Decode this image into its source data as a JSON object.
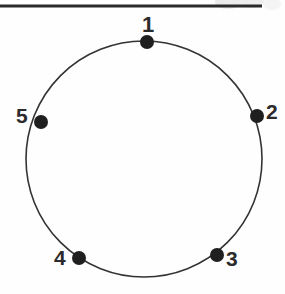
{
  "figure": {
    "type": "diagram",
    "background_color": "#fefefe",
    "ink_color": "#2b2b2b",
    "width": 285,
    "height": 294
  },
  "top_rule": {
    "name": "horizontal-rule",
    "x1": 0,
    "y1": 5,
    "x2": 262,
    "y2": 7,
    "stroke_width": 3,
    "color": "#2b2b2b"
  },
  "circle": {
    "center_x": 144,
    "center_y": 159,
    "radius": 118,
    "stroke_width": 1.6,
    "stroke_color": "#333333",
    "fill": "none"
  },
  "dot_style": {
    "radius": 7,
    "fill": "#1f1f1f"
  },
  "points": [
    {
      "label": "1",
      "x": 147,
      "y": 42,
      "angle_deg": 95,
      "label_x": 142,
      "label_y": 14,
      "label_position": "above"
    },
    {
      "label": "2",
      "x": 257,
      "y": 116,
      "angle_deg": 21,
      "label_x": 266,
      "label_y": 101,
      "label_position": "right"
    },
    {
      "label": "3",
      "x": 217,
      "y": 255,
      "angle_deg": -54,
      "label_x": 226,
      "label_y": 248,
      "label_position": "right"
    },
    {
      "label": "4",
      "x": 79,
      "y": 258,
      "angle_deg": -122,
      "label_x": 54,
      "label_y": 247,
      "label_position": "left"
    },
    {
      "label": "5",
      "x": 41,
      "y": 122,
      "angle_deg": 162,
      "label_x": 16,
      "label_y": 105,
      "label_position": "left"
    }
  ],
  "artifacts": {
    "scan_smudge_color": "#d8d8d8",
    "note": "faint gray scanning marks above the rule at upper right"
  }
}
